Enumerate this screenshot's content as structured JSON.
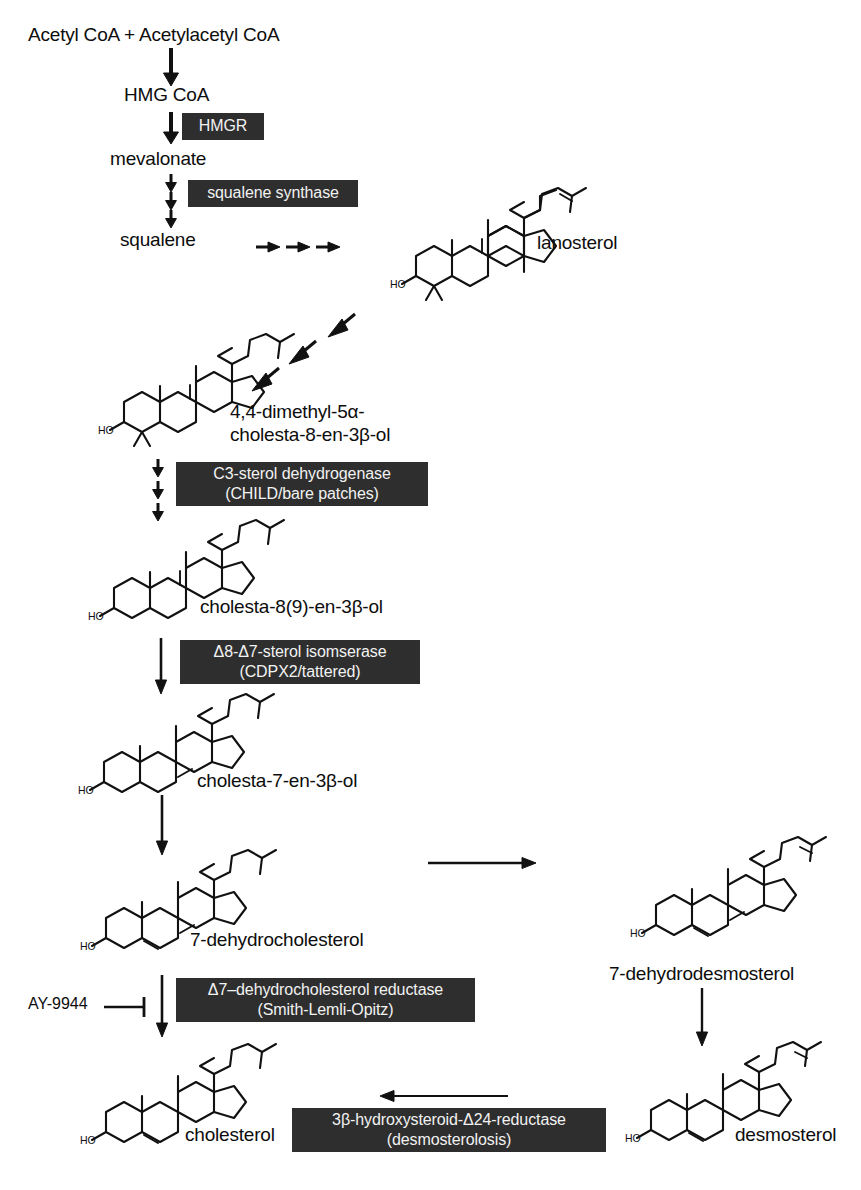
{
  "diagram": {
    "background_color": "#ffffff",
    "enzyme_box_color": "#2e2e2e",
    "enzyme_text_color": "#f2f2f2",
    "line_color": "#111111"
  },
  "metabolites": [
    {
      "id": "acetyl",
      "label": "Acetyl CoA + Acetylacetyl CoA"
    },
    {
      "id": "hmgcoa",
      "label": "HMG CoA"
    },
    {
      "id": "mevalonate",
      "label": "mevalonate"
    },
    {
      "id": "squalene",
      "label": "squalene"
    },
    {
      "id": "lanosterol",
      "label": "lanosterol"
    },
    {
      "id": "dimethyl",
      "label_line1": "4,4-dimethyl-5α-",
      "label_line2": "cholesta-8-en-3β-ol"
    },
    {
      "id": "cholesta89",
      "label": "cholesta-8(9)-en-3β-ol"
    },
    {
      "id": "cholesta7",
      "label": "cholesta-7-en-3β-ol"
    },
    {
      "id": "dhc",
      "label": "7-dehydrocholesterol"
    },
    {
      "id": "dhdesmosterol",
      "label": "7-dehydrodesmosterol"
    },
    {
      "id": "cholesterol",
      "label": "cholesterol"
    },
    {
      "id": "desmosterol",
      "label": "desmosterol"
    }
  ],
  "enzymes": [
    {
      "id": "hmgr",
      "line1": "HMGR",
      "line2": ""
    },
    {
      "id": "squalene_synthase",
      "line1": "squalene synthase",
      "line2": ""
    },
    {
      "id": "c3_sterol_dehydrogenase",
      "line1": "C3-sterol dehydrogenase",
      "line2": "(CHILD/bare patches)"
    },
    {
      "id": "sterol_isomerase",
      "line1": "Δ8-Δ7-sterol isomserase",
      "line2": "(CDPX2/tattered)"
    },
    {
      "id": "dhc_reductase",
      "line1": "Δ7–dehydrocholesterol reductase",
      "line2": "(Smith-Lemli-Opitz)"
    },
    {
      "id": "hydroxysteroid_reductase",
      "line1": "3β-hydroxysteroid-Δ24-reductase",
      "line2": "(desmosterolosis)"
    }
  ],
  "inhibitors": [
    {
      "id": "ay9944",
      "label": "AY-9944",
      "target": "dhc_reductase"
    }
  ],
  "structures": [
    {
      "id": "lanosterol-structure",
      "hydroxyl_label": "HO"
    },
    {
      "id": "dimethyl-structure",
      "hydroxyl_label": "HO"
    },
    {
      "id": "cholesta89-structure",
      "hydroxyl_label": "HO"
    },
    {
      "id": "cholesta7-structure",
      "hydroxyl_label": "HO"
    },
    {
      "id": "dhc-structure",
      "hydroxyl_label": "HO"
    },
    {
      "id": "dhdesmosterol-structure",
      "hydroxyl_label": "HO"
    },
    {
      "id": "cholesterol-structure",
      "hydroxyl_label": "HO"
    },
    {
      "id": "desmosterol-structure",
      "hydroxyl_label": "HO"
    }
  ]
}
